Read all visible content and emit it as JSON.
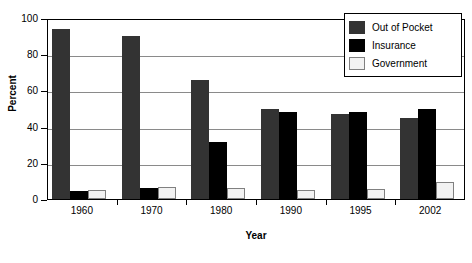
{
  "chart_data": {
    "type": "bar",
    "title": "",
    "xlabel": "Year",
    "ylabel": "Percent",
    "categories": [
      "1960",
      "1970",
      "1980",
      "1990",
      "1995",
      "2002"
    ],
    "series": [
      {
        "name": "Out of Pocket",
        "color": "#333333",
        "values": [
          94,
          90,
          66,
          50,
          47,
          45
        ]
      },
      {
        "name": "Insurance",
        "color": "#000000",
        "values": [
          4.5,
          6,
          31.5,
          48,
          48,
          50
        ]
      },
      {
        "name": "Government",
        "color": "#f2f2f2",
        "values": [
          5,
          6.5,
          6,
          5,
          5.5,
          9.5
        ]
      }
    ],
    "ylim": [
      0,
      100
    ],
    "y_ticks": [
      "0",
      "20",
      "40",
      "60",
      "80",
      "100"
    ],
    "grid": true,
    "grid_color": "#8a8a8a",
    "legend_position": "top-right",
    "axis_color": "#000000"
  }
}
